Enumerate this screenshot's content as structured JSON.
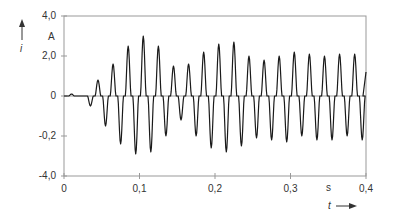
{
  "chart_data": {
    "type": "line",
    "title": "",
    "xlabel": "t",
    "xunit": "s",
    "ylabel": "i",
    "yunit": "A",
    "xlim": [
      0,
      0.4
    ],
    "ylim": [
      -4.0,
      4.0
    ],
    "grid": false,
    "legend": null,
    "x_ticks": [
      "0",
      "0,1",
      "0,2",
      "0,3",
      "0,4"
    ],
    "y_ticks": [
      "4,0",
      "2,0",
      "0",
      "-0,2",
      "-4,0"
    ],
    "y_tick_values": [
      4.0,
      2.0,
      0,
      -2.0,
      -4.0
    ],
    "series": [
      {
        "name": "i(t)",
        "peaks": [
          {
            "t": 0.01,
            "i": 0.1
          },
          {
            "t": 0.035,
            "i": -0.5
          },
          {
            "t": 0.045,
            "i": 0.8
          },
          {
            "t": 0.055,
            "i": -1.5
          },
          {
            "t": 0.065,
            "i": 1.6
          },
          {
            "t": 0.075,
            "i": -2.4
          },
          {
            "t": 0.085,
            "i": 2.5
          },
          {
            "t": 0.095,
            "i": -2.9
          },
          {
            "t": 0.105,
            "i": 3.0
          },
          {
            "t": 0.115,
            "i": -2.8
          },
          {
            "t": 0.125,
            "i": 2.5
          },
          {
            "t": 0.135,
            "i": -2.0
          },
          {
            "t": 0.145,
            "i": 1.5
          },
          {
            "t": 0.155,
            "i": -1.2
          },
          {
            "t": 0.165,
            "i": 1.6
          },
          {
            "t": 0.175,
            "i": -2.0
          },
          {
            "t": 0.185,
            "i": 2.2
          },
          {
            "t": 0.195,
            "i": -2.6
          },
          {
            "t": 0.205,
            "i": 2.6
          },
          {
            "t": 0.215,
            "i": -2.8
          },
          {
            "t": 0.225,
            "i": 2.7
          },
          {
            "t": 0.235,
            "i": -2.5
          },
          {
            "t": 0.245,
            "i": 2.0
          },
          {
            "t": 0.255,
            "i": -2.1
          },
          {
            "t": 0.265,
            "i": 1.8
          },
          {
            "t": 0.275,
            "i": -2.2
          },
          {
            "t": 0.285,
            "i": 2.0
          },
          {
            "t": 0.295,
            "i": -2.3
          },
          {
            "t": 0.305,
            "i": 2.2
          },
          {
            "t": 0.315,
            "i": -2.0
          },
          {
            "t": 0.325,
            "i": 2.1
          },
          {
            "t": 0.335,
            "i": -2.2
          },
          {
            "t": 0.345,
            "i": 2.0
          },
          {
            "t": 0.355,
            "i": -2.2
          },
          {
            "t": 0.365,
            "i": 2.1
          },
          {
            "t": 0.375,
            "i": -2.0
          },
          {
            "t": 0.385,
            "i": 2.1
          },
          {
            "t": 0.395,
            "i": -2.2
          },
          {
            "t": 0.4,
            "i": 1.2
          }
        ]
      }
    ]
  },
  "axis": {
    "y_symbol": "i",
    "y_unit": "A",
    "x_symbol": "t",
    "x_unit": "s"
  },
  "colors": {
    "line": "#1a1a1a",
    "axis": "#888888",
    "text": "#333333"
  }
}
